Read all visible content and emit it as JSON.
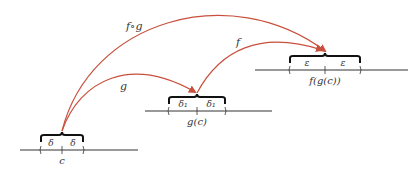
{
  "diagram": {
    "type": "function-composition-continuity",
    "arrow_color": "#c8503c",
    "line_color": "#333333",
    "arrows": [
      {
        "id": "g",
        "label": "g",
        "from": "c",
        "to": "g(c)"
      },
      {
        "id": "f",
        "label": "f",
        "from": "g(c)",
        "to": "f(g(c))"
      },
      {
        "id": "fog",
        "label": "f∘g",
        "from": "c",
        "to": "f(g(c))"
      }
    ],
    "number_lines": [
      {
        "point_label": "c",
        "interval_labels": [
          "δ",
          "δ"
        ]
      },
      {
        "point_label": "g(c)",
        "interval_labels": [
          "δ₁",
          "δ₁"
        ]
      },
      {
        "point_label": "f(g(c))",
        "interval_labels": [
          "ε",
          "ε"
        ]
      }
    ]
  }
}
